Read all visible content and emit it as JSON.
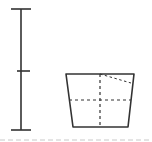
{
  "figure": {
    "colors": {
      "stroke": "#333333",
      "background": "#ffffff",
      "baseline": "#c8c8c8"
    },
    "scale_bar": {
      "segments": 2,
      "x": 21,
      "top_y": 9,
      "mid_y": 71,
      "bottom_y": 130
    },
    "vessel": {
      "rim_left": [
        66,
        74
      ],
      "rim_right": [
        134,
        74
      ],
      "base_left": [
        73,
        127
      ],
      "base_right": [
        128,
        127
      ],
      "axis_x": 100,
      "section_line_y": 100,
      "slant_line": [
        [
          100,
          74
        ],
        [
          131,
          83
        ]
      ]
    },
    "baseline": {
      "y": 140,
      "style": "dashed"
    }
  }
}
